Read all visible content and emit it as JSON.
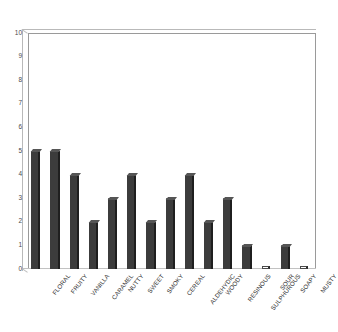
{
  "chart_data": {
    "type": "bar",
    "title": "",
    "subtitle": "",
    "xlabel": "",
    "ylabel": "",
    "ylim": [
      0,
      10
    ],
    "ytick_labels": [
      "10",
      "9",
      "8",
      "7",
      "6",
      "5",
      "4",
      "3",
      "2",
      "1",
      "0"
    ],
    "yticks": [
      10,
      9,
      8,
      7,
      6,
      5,
      4,
      3,
      2,
      1,
      0
    ],
    "grid": false,
    "legend": null,
    "bar_color": "#3c3c3c",
    "plot_background": "#ffffff",
    "axis_color": "#9a9a9a",
    "categories": [
      "FLORAL",
      "FRUITY",
      "VANILLA",
      "CARAMEL",
      "NUTTY",
      "SWEET",
      "SMOKY",
      "CEREAL",
      "ALDEHYDIC",
      "WOODY",
      "RESINOUS",
      "SULPHUROUS",
      "SOUR",
      "SOAPY",
      "MUSTY"
    ],
    "values": [
      5,
      5,
      4,
      2,
      3,
      4,
      2,
      3,
      4,
      2,
      3,
      1,
      0,
      1,
      0
    ]
  }
}
